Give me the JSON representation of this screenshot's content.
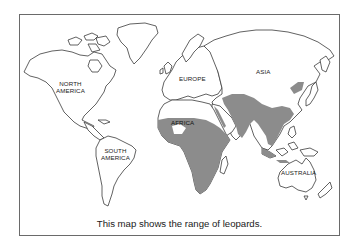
{
  "map": {
    "type": "world-outline",
    "colors": {
      "background": "#ffffff",
      "land_fill": "#ffffff",
      "outline": "#3a3a3a",
      "range_fill": "#8c8c8c",
      "frame": "#6a6a6a"
    },
    "labels": {
      "north_america": "NORTH\nAMERICA",
      "south_america": "SOUTH\nAMERICA",
      "europe": "EUROPE",
      "africa": "AFRICA",
      "asia": "ASIA",
      "australia": "AUSTRALIA"
    },
    "legend": {
      "shaded_region": "range of leopards",
      "shaded_areas": [
        "Sub-Saharan Africa",
        "Arabian Peninsula coast",
        "Middle East / Central Asia",
        "Indian Subcontinent",
        "Southeast Asia",
        "East Asia / Korea region",
        "Indonesian islands"
      ]
    },
    "caption": "This map shows the range of leopards."
  }
}
